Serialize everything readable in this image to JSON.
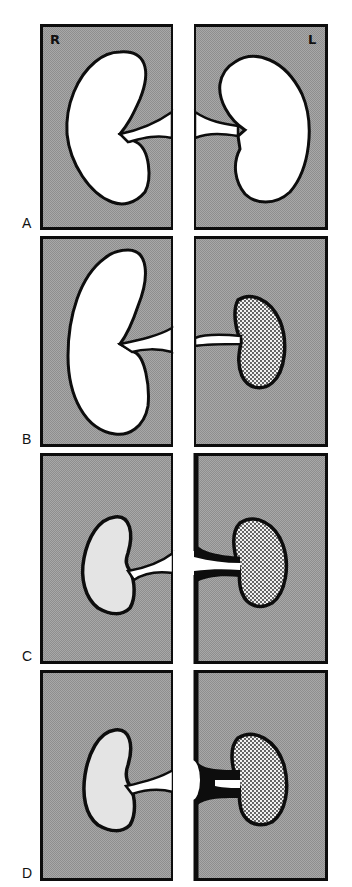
{
  "figure": {
    "side_labels": {
      "right": "R",
      "left": "L"
    },
    "colors": {
      "background_gray": "#9c9c9c",
      "outline": "#0d0d0d",
      "vessel": "#ffffff",
      "kidney_normal": "#ffffff",
      "kidney_reduced": "#e4e4e4",
      "kidney_stippled": "#dcdcdc"
    },
    "panels": [
      {
        "label": "A",
        "description": "Two normal-size kidneys with normal renal arteries from the aorta"
      },
      {
        "label": "B",
        "description": "Large right kidney; small stippled left kidney with narrowed left renal artery"
      },
      {
        "label": "C",
        "description": "Reduced right kidney (light gray); stippled left kidney; thickened wall at left renal artery origin"
      },
      {
        "label": "D",
        "description": "Reduced right kidney; stippled left kidney; heavy black stenotic plaque at left renal artery origin"
      }
    ]
  }
}
